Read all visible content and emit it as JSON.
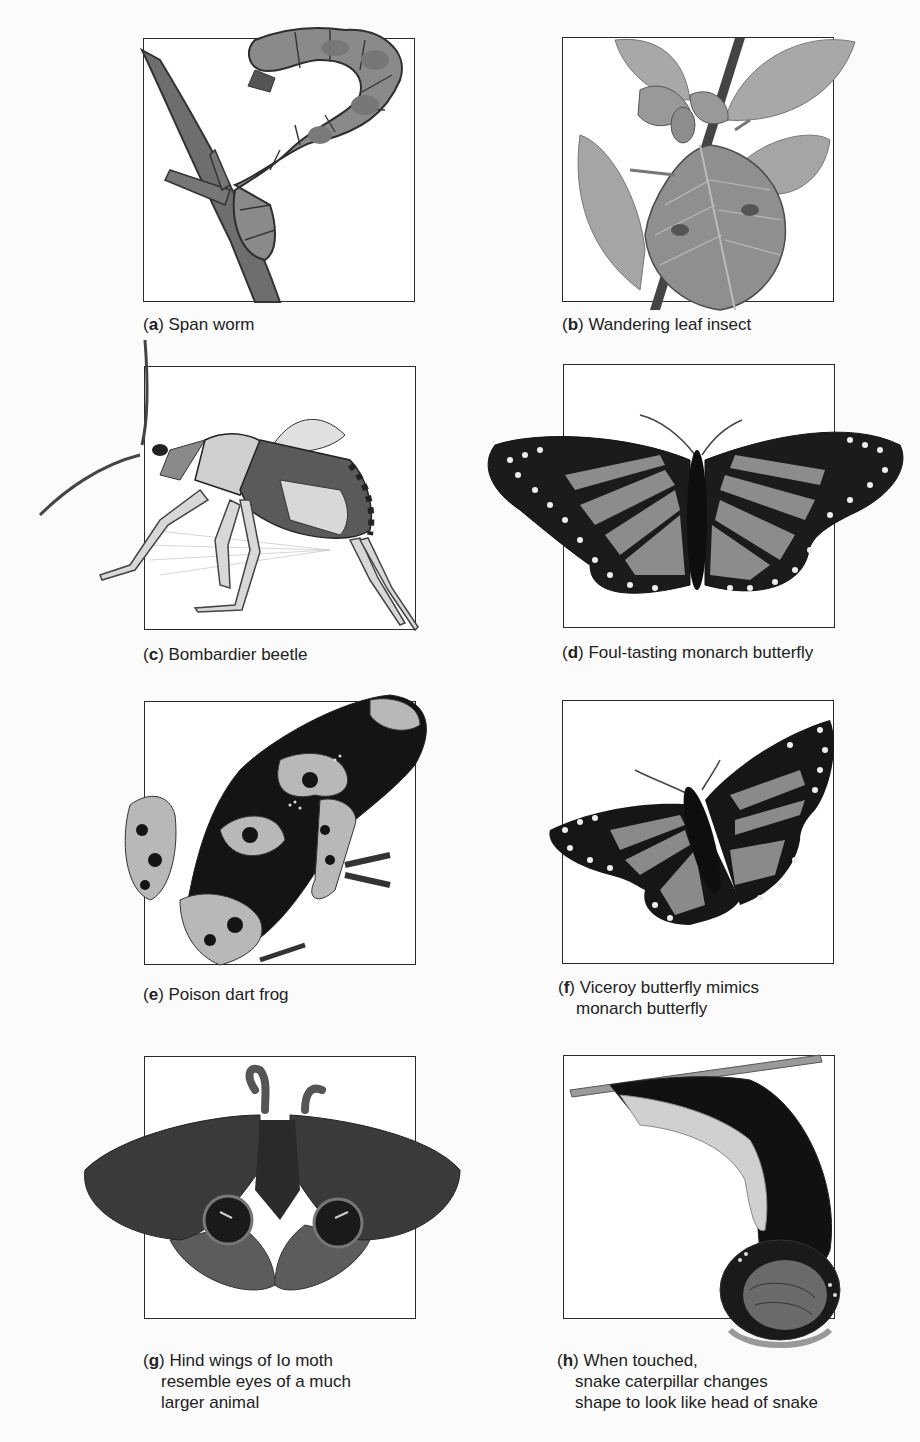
{
  "figure": {
    "panels": [
      {
        "id": "a",
        "letter": "a",
        "caption_lines": [
          "Span worm"
        ],
        "illustration": "span-worm-illustration"
      },
      {
        "id": "b",
        "letter": "b",
        "caption_lines": [
          "Wandering leaf insect"
        ],
        "illustration": "leaf-insect-illustration"
      },
      {
        "id": "c",
        "letter": "c",
        "caption_lines": [
          "Bombardier beetle"
        ],
        "illustration": "bombardier-beetle-illustration"
      },
      {
        "id": "d",
        "letter": "d",
        "caption_lines": [
          "Foul-tasting monarch butterfly"
        ],
        "illustration": "monarch-butterfly-illustration"
      },
      {
        "id": "e",
        "letter": "e",
        "caption_lines": [
          "Poison dart frog"
        ],
        "illustration": "poison-dart-frog-illustration"
      },
      {
        "id": "f",
        "letter": "f",
        "caption_lines": [
          "Viceroy butterfly mimics",
          "monarch butterfly"
        ],
        "illustration": "viceroy-butterfly-illustration"
      },
      {
        "id": "g",
        "letter": "g",
        "caption_lines": [
          "Hind wings of Io moth",
          "resemble eyes of a much",
          "larger animal"
        ],
        "illustration": "io-moth-illustration"
      },
      {
        "id": "h",
        "letter": "h",
        "caption_lines": [
          "When touched,",
          "snake caterpillar changes",
          "shape to look like head of snake"
        ],
        "illustration": "snake-caterpillar-illustration"
      }
    ]
  },
  "colors": {
    "frame": "#2a2a2a",
    "caption_text": "#222222",
    "background": "#fbfbfb"
  }
}
